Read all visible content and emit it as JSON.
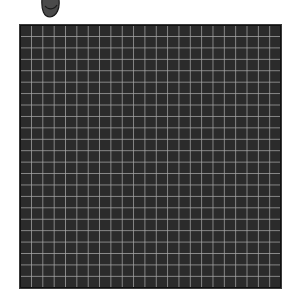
{
  "scene": {
    "icon": {
      "name": "pebble-icon",
      "fill": "#4a4a4a",
      "stroke": "#1a1a1a"
    },
    "grid": {
      "columns": 23,
      "rows": 23,
      "background_color": "#2b2b2b",
      "line_color": "#aaaaaa",
      "border_color": "#111111"
    }
  }
}
